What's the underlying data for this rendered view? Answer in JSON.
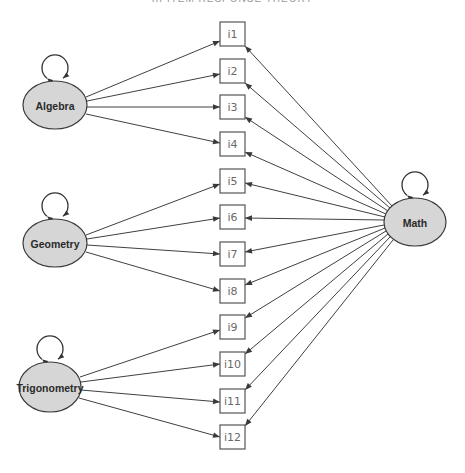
{
  "header": {
    "corner_text": "",
    "title": "III ITEM RESPONSE THEORY"
  },
  "colors": {
    "latent_fill": "#d6d6d6",
    "latent_stroke": "#3a3a3a",
    "item_stroke": "#555555",
    "item_text": "#6a6a6a",
    "edge": "#404040"
  },
  "diagram": {
    "latent_nodes": [
      {
        "id": "algebra",
        "label": "Algebra",
        "cx": 55,
        "cy": 105,
        "rx": 32,
        "ry": 24
      },
      {
        "id": "geometry",
        "label": "Geometry",
        "cx": 55,
        "cy": 243,
        "rx": 32,
        "ry": 24
      },
      {
        "id": "trigonometry",
        "label": "Trigonometry",
        "cx": 50,
        "cy": 387,
        "rx": 31,
        "ry": 25
      },
      {
        "id": "math",
        "label": "Math",
        "cx": 415,
        "cy": 222,
        "rx": 31,
        "ry": 24
      }
    ],
    "items": [
      {
        "id": "i1",
        "label": "i1",
        "x": 220,
        "y": 22
      },
      {
        "id": "i2",
        "label": "i2",
        "x": 220,
        "y": 59
      },
      {
        "id": "i3",
        "label": "i3",
        "x": 220,
        "y": 95
      },
      {
        "id": "i4",
        "label": "i4",
        "x": 220,
        "y": 132
      },
      {
        "id": "i5",
        "label": "i5",
        "x": 220,
        "y": 169
      },
      {
        "id": "i6",
        "label": "i6",
        "x": 220,
        "y": 205
      },
      {
        "id": "i7",
        "label": "i7",
        "x": 220,
        "y": 242
      },
      {
        "id": "i8",
        "label": "i8",
        "x": 220,
        "y": 279
      },
      {
        "id": "i9",
        "label": "i9",
        "x": 220,
        "y": 315
      },
      {
        "id": "i10",
        "label": "i10",
        "x": 220,
        "y": 352
      },
      {
        "id": "i11",
        "label": "i11",
        "x": 220,
        "y": 389
      },
      {
        "id": "i12",
        "label": "i12",
        "x": 220,
        "y": 425
      }
    ],
    "item_size": {
      "w": 25,
      "h": 24
    },
    "edges": [
      {
        "from": "algebra",
        "to": "i1",
        "x1": 86,
        "y1": 97,
        "x2": 220,
        "y2": 41
      },
      {
        "from": "algebra",
        "to": "i2",
        "x1": 87,
        "y1": 101,
        "x2": 220,
        "y2": 74
      },
      {
        "from": "algebra",
        "to": "i3",
        "x1": 87,
        "y1": 107,
        "x2": 220,
        "y2": 107
      },
      {
        "from": "algebra",
        "to": "i4",
        "x1": 86,
        "y1": 114,
        "x2": 220,
        "y2": 143
      },
      {
        "from": "geometry",
        "to": "i5",
        "x1": 86,
        "y1": 235,
        "x2": 220,
        "y2": 184
      },
      {
        "from": "geometry",
        "to": "i6",
        "x1": 87,
        "y1": 239,
        "x2": 220,
        "y2": 218
      },
      {
        "from": "geometry",
        "to": "i7",
        "x1": 87,
        "y1": 245,
        "x2": 220,
        "y2": 254
      },
      {
        "from": "geometry",
        "to": "i8",
        "x1": 86,
        "y1": 252,
        "x2": 220,
        "y2": 291
      },
      {
        "from": "trigonometry",
        "to": "i9",
        "x1": 80,
        "y1": 377,
        "x2": 220,
        "y2": 330
      },
      {
        "from": "trigonometry",
        "to": "i10",
        "x1": 81,
        "y1": 382,
        "x2": 220,
        "y2": 364
      },
      {
        "from": "trigonometry",
        "to": "i11",
        "x1": 81,
        "y1": 390,
        "x2": 220,
        "y2": 402
      },
      {
        "from": "trigonometry",
        "to": "i12",
        "x1": 79,
        "y1": 398,
        "x2": 220,
        "y2": 437
      },
      {
        "from": "math",
        "to": "i1",
        "x1": 392,
        "y1": 206,
        "x2": 245,
        "y2": 46
      },
      {
        "from": "math",
        "to": "i2",
        "x1": 390,
        "y1": 208,
        "x2": 245,
        "y2": 83
      },
      {
        "from": "math",
        "to": "i3",
        "x1": 388,
        "y1": 211,
        "x2": 245,
        "y2": 117
      },
      {
        "from": "math",
        "to": "i4",
        "x1": 386,
        "y1": 214,
        "x2": 245,
        "y2": 152
      },
      {
        "from": "math",
        "to": "i5",
        "x1": 385,
        "y1": 217,
        "x2": 245,
        "y2": 183
      },
      {
        "from": "math",
        "to": "i6",
        "x1": 384,
        "y1": 220,
        "x2": 245,
        "y2": 218
      },
      {
        "from": "math",
        "to": "i7",
        "x1": 384,
        "y1": 225,
        "x2": 245,
        "y2": 252
      },
      {
        "from": "math",
        "to": "i8",
        "x1": 385,
        "y1": 228,
        "x2": 245,
        "y2": 285
      },
      {
        "from": "math",
        "to": "i9",
        "x1": 386,
        "y1": 231,
        "x2": 245,
        "y2": 318
      },
      {
        "from": "math",
        "to": "i10",
        "x1": 388,
        "y1": 234,
        "x2": 245,
        "y2": 354
      },
      {
        "from": "math",
        "to": "i11",
        "x1": 390,
        "y1": 237,
        "x2": 245,
        "y2": 390
      },
      {
        "from": "math",
        "to": "i12",
        "x1": 393,
        "y1": 240,
        "x2": 245,
        "y2": 426
      }
    ],
    "self_loops": [
      {
        "node": "algebra",
        "cx": 55,
        "cy": 68,
        "r": 13
      },
      {
        "node": "geometry",
        "cx": 55,
        "cy": 206,
        "r": 13
      },
      {
        "node": "trigonometry",
        "cx": 50,
        "cy": 349,
        "r": 13
      },
      {
        "node": "math",
        "cx": 415,
        "cy": 185,
        "r": 13
      }
    ]
  }
}
